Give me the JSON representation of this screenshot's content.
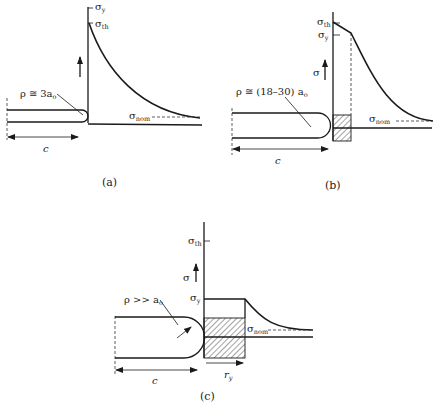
{
  "figure": {
    "panels": [
      {
        "id": "a",
        "caption": "(a)",
        "radius_label": "ρ ≅ 3a",
        "radius_sub": "o",
        "length_label": "c",
        "stress_labels": {
          "yield": {
            "symbol": "σ",
            "sub": "y"
          },
          "theoretical": {
            "symbol": "σ",
            "sub": "th"
          },
          "nominal": {
            "symbol": "σ",
            "sub": "nom"
          }
        },
        "axis_arrow": "↑"
      },
      {
        "id": "b",
        "caption": "(b)",
        "radius_label": "ρ ≅ (18–30) a",
        "radius_sub": "o",
        "length_label": "c",
        "axis_label": "σ",
        "stress_labels": {
          "theoretical": {
            "symbol": "σ",
            "sub": "th"
          },
          "yield": {
            "symbol": "σ",
            "sub": "y"
          },
          "nominal": {
            "symbol": "σ",
            "sub": "nom"
          }
        }
      },
      {
        "id": "c",
        "caption": "(c)",
        "radius_label": "ρ >> a",
        "radius_sub": "o",
        "length_label": "c",
        "axis_label": "σ",
        "plastic_zone_label": "r",
        "plastic_zone_sub": "y",
        "stress_labels": {
          "theoretical": {
            "symbol": "σ",
            "sub": "th"
          },
          "yield": {
            "symbol": "σ",
            "sub": "y"
          },
          "nominal": {
            "symbol": "σ",
            "sub": "nom"
          }
        }
      }
    ]
  },
  "colors": {
    "ink": "#1a1a1a",
    "background": "#ffffff"
  }
}
